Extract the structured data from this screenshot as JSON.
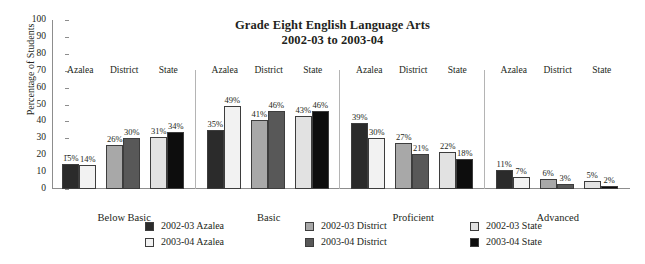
{
  "chart_data": {
    "type": "bar",
    "title": "Grade Eight English Language Arts",
    "subtitle": "2002-03 to 2003-04",
    "xlabel": "",
    "ylabel": "Percentage of Students",
    "ylim": [
      0,
      100
    ],
    "ytick_values": [
      100,
      90,
      80,
      70,
      60,
      50,
      40,
      30,
      20,
      10,
      0
    ],
    "grid": false,
    "legend_position": "bottom",
    "categories": [
      "Below Basic",
      "Basic",
      "Proficient",
      "Advanced"
    ],
    "subgroups": [
      "Azalea",
      "District",
      "State"
    ],
    "series": [
      {
        "name": "2002-03 Azalea",
        "color": "#2b2b2b",
        "values": [
          15,
          35,
          39,
          11
        ]
      },
      {
        "name": "2003-04 Azalea",
        "color": "#f2f2f2",
        "values": [
          14,
          49,
          30,
          7
        ]
      },
      {
        "name": "2002-03 District",
        "color": "#a8a8a8",
        "values": [
          26,
          41,
          27,
          6
        ]
      },
      {
        "name": "2003-04 District",
        "color": "#585858",
        "values": [
          30,
          46,
          21,
          3
        ]
      },
      {
        "name": "2002-03 State",
        "color": "#e2e2e2",
        "values": [
          31,
          43,
          22,
          5
        ]
      },
      {
        "name": "2003-04 State",
        "color": "#0d0d0d",
        "values": [
          34,
          46,
          18,
          2
        ]
      }
    ],
    "bars": [
      {
        "category": "Below Basic",
        "subgroup": "Azalea",
        "year": "2002-03",
        "value": 15,
        "label": "15%",
        "color": "#2b2b2b"
      },
      {
        "category": "Below Basic",
        "subgroup": "Azalea",
        "year": "2003-04",
        "value": 14,
        "label": "14%",
        "color": "#f2f2f2"
      },
      {
        "category": "Below Basic",
        "subgroup": "District",
        "year": "2002-03",
        "value": 26,
        "label": "26%",
        "color": "#a8a8a8"
      },
      {
        "category": "Below Basic",
        "subgroup": "District",
        "year": "2003-04",
        "value": 30,
        "label": "30%",
        "color": "#585858"
      },
      {
        "category": "Below Basic",
        "subgroup": "State",
        "year": "2002-03",
        "value": 31,
        "label": "31%",
        "color": "#e2e2e2"
      },
      {
        "category": "Below Basic",
        "subgroup": "State",
        "year": "2003-04",
        "value": 34,
        "label": "34%",
        "color": "#0d0d0d"
      },
      {
        "category": "Basic",
        "subgroup": "Azalea",
        "year": "2002-03",
        "value": 35,
        "label": "35%",
        "color": "#2b2b2b"
      },
      {
        "category": "Basic",
        "subgroup": "Azalea",
        "year": "2003-04",
        "value": 49,
        "label": "49%",
        "color": "#f2f2f2"
      },
      {
        "category": "Basic",
        "subgroup": "District",
        "year": "2002-03",
        "value": 41,
        "label": "41%",
        "color": "#a8a8a8"
      },
      {
        "category": "Basic",
        "subgroup": "District",
        "year": "2003-04",
        "value": 46,
        "label": "46%",
        "color": "#585858"
      },
      {
        "category": "Basic",
        "subgroup": "State",
        "year": "2002-03",
        "value": 43,
        "label": "43%",
        "color": "#e2e2e2"
      },
      {
        "category": "Basic",
        "subgroup": "State",
        "year": "2003-04",
        "value": 46,
        "label": "46%",
        "color": "#0d0d0d"
      },
      {
        "category": "Proficient",
        "subgroup": "Azalea",
        "year": "2002-03",
        "value": 39,
        "label": "39%",
        "color": "#2b2b2b"
      },
      {
        "category": "Proficient",
        "subgroup": "Azalea",
        "year": "2003-04",
        "value": 30,
        "label": "30%",
        "color": "#f2f2f2"
      },
      {
        "category": "Proficient",
        "subgroup": "District",
        "year": "2002-03",
        "value": 27,
        "label": "27%",
        "color": "#a8a8a8"
      },
      {
        "category": "Proficient",
        "subgroup": "District",
        "year": "2003-04",
        "value": 21,
        "label": "21%",
        "color": "#585858"
      },
      {
        "category": "Proficient",
        "subgroup": "State",
        "year": "2002-03",
        "value": 22,
        "label": "22%",
        "color": "#e2e2e2"
      },
      {
        "category": "Proficient",
        "subgroup": "State",
        "year": "2003-04",
        "value": 18,
        "label": "18%",
        "color": "#0d0d0d"
      },
      {
        "category": "Advanced",
        "subgroup": "Azalea",
        "year": "2002-03",
        "value": 11,
        "label": "11%",
        "color": "#2b2b2b"
      },
      {
        "category": "Advanced",
        "subgroup": "Azalea",
        "year": "2003-04",
        "value": 7,
        "label": "7%",
        "color": "#f2f2f2"
      },
      {
        "category": "Advanced",
        "subgroup": "District",
        "year": "2002-03",
        "value": 6,
        "label": "6%",
        "color": "#a8a8a8"
      },
      {
        "category": "Advanced",
        "subgroup": "District",
        "year": "2003-04",
        "value": 3,
        "label": "3%",
        "color": "#585858"
      },
      {
        "category": "Advanced",
        "subgroup": "State",
        "year": "2002-03",
        "value": 5,
        "label": "5%",
        "color": "#e2e2e2"
      },
      {
        "category": "Advanced",
        "subgroup": "State",
        "year": "2003-04",
        "value": 2,
        "label": "2%",
        "color": "#0d0d0d"
      }
    ]
  },
  "legend": {
    "columns": [
      {
        "items": [
          {
            "label": "2002-03 Azalea",
            "color": "#2b2b2b"
          },
          {
            "label": "2003-04 Azalea",
            "color": "#f2f2f2"
          }
        ]
      },
      {
        "items": [
          {
            "label": "2002-03 District",
            "color": "#a8a8a8"
          },
          {
            "label": "2003-04 District",
            "color": "#585858"
          }
        ]
      },
      {
        "items": [
          {
            "label": "2002-03 State",
            "color": "#e2e2e2"
          },
          {
            "label": "2003-04 State",
            "color": "#0d0d0d"
          }
        ]
      }
    ]
  },
  "colors": {
    "axis": "#8d8d8d",
    "divider": "#b4b4b4",
    "text": "#231f20",
    "bar_stroke": "#3d3d3d",
    "background": "#ffffff"
  }
}
